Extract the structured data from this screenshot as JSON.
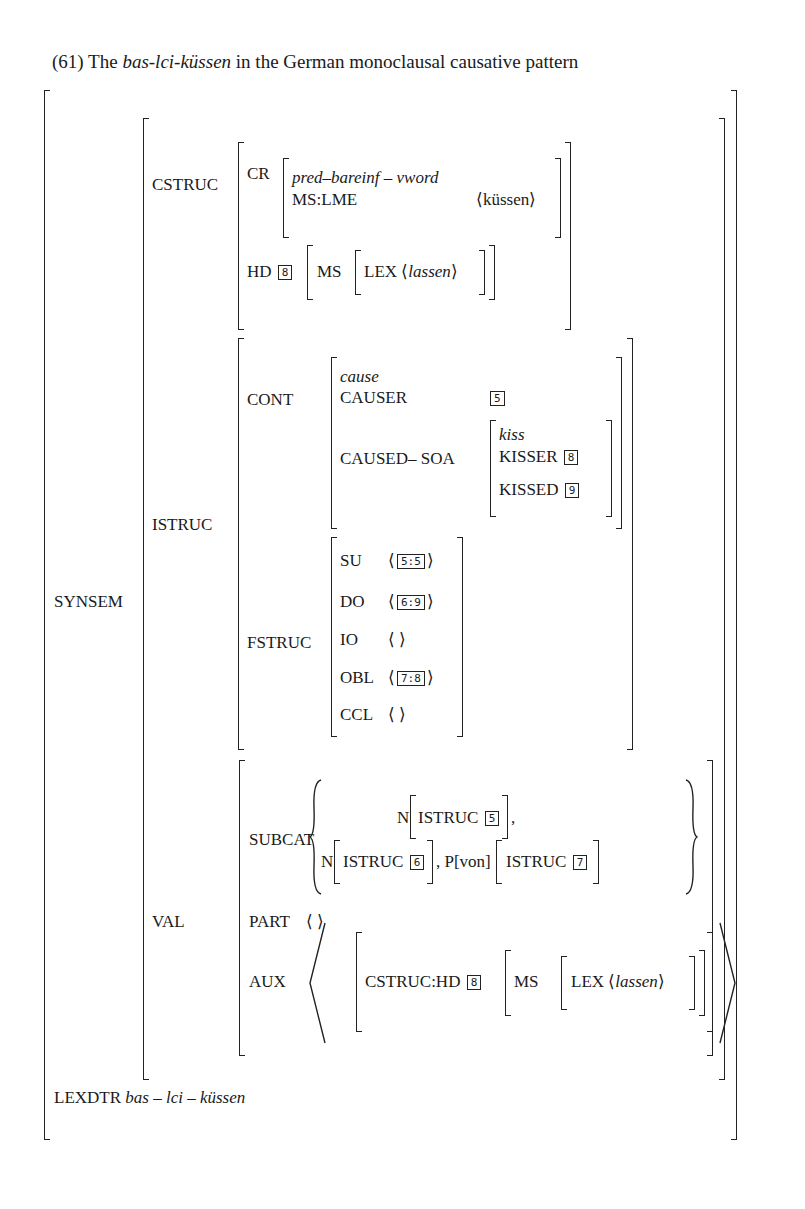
{
  "caption": {
    "number": "(61)",
    "pre": "The",
    "italic": "bas-lci-küssen",
    "post": "in the German monoclausal causative pattern"
  },
  "synsem": {
    "label": "SYNSEM",
    "cstruc": {
      "label": "CSTRUC",
      "cr": {
        "label": "CR",
        "type": "pred–bareinf – vword",
        "ms_lme_label": "MS:LME",
        "ms_lme_value": "küssen"
      },
      "hd": {
        "label": "HD",
        "tag": "8",
        "ms_label": "MS",
        "lex_label": "LEX",
        "lex_value": "lassen"
      }
    },
    "istruc": {
      "label": "ISTRUC",
      "cont": {
        "label": "CONT",
        "type": "cause",
        "causer_label": "CAUSER",
        "causer_tag": "5",
        "caused_soa_label": "CAUSED– SOA",
        "soa_type": "kiss",
        "kisser_label": "KISSER",
        "kisser_tag": "8",
        "kissed_label": "KISSED",
        "kissed_tag": "9"
      },
      "fstruc": {
        "label": "FSTRUC",
        "rows": [
          {
            "label": "SU",
            "value": "5:5"
          },
          {
            "label": "DO",
            "value": "6:9"
          },
          {
            "label": "IO",
            "value": ""
          },
          {
            "label": "OBL",
            "value": "7:8"
          },
          {
            "label": "CCL",
            "value": ""
          }
        ]
      }
    },
    "val": {
      "label": "VAL",
      "subcat": {
        "label": "SUBCAT",
        "line1_n": "N",
        "line1_istruc": "ISTRUC",
        "line1_tag": "5",
        "line2_n": "N",
        "line2_istruc": "ISTRUC",
        "line2_tag": "6",
        "line2_p": "P[von]",
        "line2_istruc2": "ISTRUC",
        "line2_tag2": "7"
      },
      "part": {
        "label": "PART",
        "value": "⟨ ⟩"
      },
      "aux": {
        "label": "AUX",
        "path": "CSTRUC:HD",
        "tag": "8",
        "ms_label": "MS",
        "lex_label": "LEX",
        "lex_value": "lassen"
      }
    }
  },
  "lexdtr": {
    "label": "LEXDTR",
    "value": "bas – lci – küssen"
  }
}
